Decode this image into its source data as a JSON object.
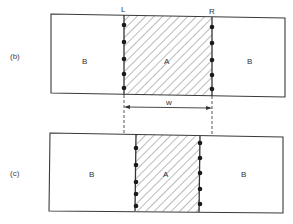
{
  "figure": {
    "panels": [
      {
        "id": "b",
        "label": "(b)",
        "left_region_label": "B",
        "center_region_label": "A",
        "right_region_label": "B",
        "left_boundary_label": "L",
        "right_boundary_label": "R",
        "dots_left": 5,
        "dots_right": 5
      },
      {
        "id": "c",
        "label": "(c)",
        "left_region_label": "B",
        "center_region_label": "A",
        "right_region_label": "B",
        "dots_left": 5,
        "dots_right": 5
      }
    ],
    "width_label": "w"
  },
  "colors": {
    "line": "#3a3a3a",
    "hatch": "#555555",
    "dot": "#1a1a1a"
  }
}
